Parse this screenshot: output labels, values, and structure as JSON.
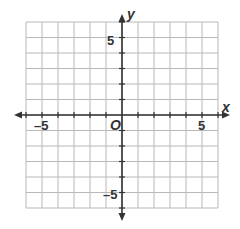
{
  "diagram": {
    "type": "coordinate-plane",
    "x_range": [
      -6,
      6
    ],
    "y_range": [
      -6,
      6
    ],
    "grid_step": 1,
    "axis_labels": {
      "x": "x",
      "y": "y"
    },
    "origin_label": "O",
    "tick_labels": {
      "x_neg": "–5",
      "x_pos": "5",
      "y_pos": "5",
      "y_neg": "–5"
    },
    "colors": {
      "grid": "#b8b8b8",
      "axis": "#333333",
      "background": "#ffffff"
    }
  }
}
